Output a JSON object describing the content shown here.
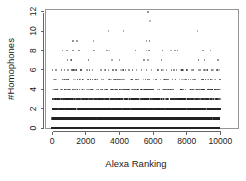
{
  "chart_data": {
    "type": "scatter",
    "title": "",
    "subtitle": "",
    "xlabel": "Alexa Ranking",
    "ylabel": "#Homophones",
    "xlim": [
      0,
      10000
    ],
    "ylim": [
      0,
      12
    ],
    "grid": false,
    "legend": null,
    "xticks": [
      0,
      2000,
      4000,
      6000,
      8000,
      10000
    ],
    "xtick_labels": [
      "0",
      "2000",
      "4000",
      "6000",
      "8000",
      "10000"
    ],
    "yticks": [
      0,
      2,
      4,
      6,
      8,
      10,
      12
    ],
    "ytick_labels": [
      "0",
      "2",
      "4",
      "6",
      "8",
      "10",
      "12"
    ],
    "marker": "square",
    "marker_color": "#222222",
    "bands": [
      {
        "y": 0,
        "density": 1.0,
        "count": 900,
        "opacity": 0.95,
        "note": "near-solid black band"
      },
      {
        "y": 1,
        "density": 0.96,
        "count": 820,
        "opacity": 0.92,
        "note": "near-solid black band"
      },
      {
        "y": 2,
        "density": 0.8,
        "count": 560,
        "opacity": 0.8,
        "note": "dense band"
      },
      {
        "y": 3,
        "density": 0.62,
        "count": 360,
        "opacity": 0.68,
        "note": "dense band with gaps"
      },
      {
        "y": 4,
        "density": 0.36,
        "count": 190,
        "opacity": 0.55,
        "note": "medium sparse band"
      },
      {
        "y": 5,
        "density": 0.2,
        "count": 105,
        "opacity": 0.5,
        "note": "sparse band"
      },
      {
        "y": 6,
        "density": 0.075,
        "count": 40,
        "opacity": 0.45,
        "note": "scattered points"
      },
      {
        "y": 7,
        "density": 0.04,
        "count": 21,
        "opacity": 0.42,
        "note": "scattered points"
      },
      {
        "y": 8,
        "density": 0.035,
        "count": 19,
        "opacity": 0.42,
        "note": "scattered points"
      },
      {
        "y": 9,
        "density": 0.013,
        "count": 7,
        "opacity": 0.4,
        "note": "few points"
      },
      {
        "y": 10,
        "density": 0.006,
        "count": 3,
        "opacity": 0.38,
        "note": "three points"
      },
      {
        "y": 11,
        "density": 0.002,
        "count": 1,
        "opacity": 0.38,
        "note": "single point"
      },
      {
        "y": 12,
        "density": 0.002,
        "count": 1,
        "opacity": 0.38,
        "note": "single point"
      }
    ],
    "sparse_points": {
      "12": [
        5700
      ],
      "11": [
        5800
      ],
      "10": [
        3350,
        4250,
        8650
      ],
      "9": [
        1220,
        1480,
        2450,
        5600,
        5780
      ],
      "8": [
        620,
        870,
        1250,
        1600,
        2480,
        3250,
        3400,
        4950,
        5600,
        5750,
        6550,
        7050,
        7300,
        7450,
        8950,
        9400
      ],
      "7": [
        900,
        1100,
        1150,
        2150,
        3550,
        4000,
        5450,
        5700,
        6500,
        8700,
        9050,
        9850
      ],
      "6": [
        560,
        720,
        1150,
        1300,
        1450,
        1700,
        2100,
        2400,
        2900,
        3150,
        3600,
        4200,
        4550,
        5000,
        5300,
        5600,
        5900,
        6250,
        6500,
        6800,
        7100,
        7400,
        7700,
        8000,
        8400,
        8800,
        9100,
        9500,
        9800
      ]
    }
  },
  "figure": {
    "xlabel": "Alexa Ranking",
    "ylabel": "#Homophones",
    "xtick_labels": [
      "0",
      "2000",
      "4000",
      "6000",
      "8000",
      "10000"
    ],
    "ytick_labels": [
      "0",
      "2",
      "4",
      "6",
      "8",
      "10",
      "12"
    ]
  }
}
